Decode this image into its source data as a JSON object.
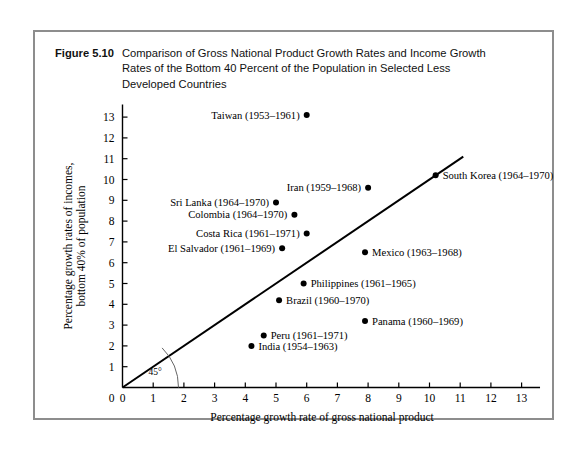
{
  "figure": {
    "label": "Figure 5.10",
    "caption_line1": "Comparison of Gross National Product Growth Rates and Income Growth",
    "caption_line2": "Rates of the Bottom 40 Percent of the Population in Selected Less",
    "caption_line3": "Developed Countries"
  },
  "chart_data": {
    "type": "scatter",
    "title": "",
    "xlabel": "Percentage growth rate of gross national product",
    "ylabel_line1": "Percentage growth rates of incomes,",
    "ylabel_line2": "bottom 40% of population",
    "xlim": [
      0,
      13.6
    ],
    "ylim": [
      0,
      13.6
    ],
    "xticks": [
      0,
      1,
      2,
      3,
      4,
      5,
      6,
      7,
      8,
      9,
      10,
      11,
      12,
      13
    ],
    "yticks": [
      0,
      1,
      2,
      3,
      4,
      5,
      6,
      7,
      8,
      9,
      10,
      11,
      12,
      13
    ],
    "xtick_labels": [
      "0",
      "1",
      "2",
      "3",
      "4",
      "5",
      "6",
      "7",
      "8",
      "9",
      "10",
      "11",
      "12",
      "13"
    ],
    "ytick_labels": [
      "0",
      "1",
      "2",
      "3",
      "4",
      "5",
      "6",
      "7",
      "8",
      "9",
      "10",
      "11",
      "12",
      "13"
    ],
    "grid": false,
    "legend": "none",
    "reference_line": {
      "name": "45-degree line",
      "annotation": "45°",
      "from": [
        0,
        0
      ],
      "to": [
        11.1,
        11.1
      ],
      "slope": 1
    },
    "points": [
      {
        "name": "Taiwan (1953–1961)",
        "x": 6.0,
        "y": 13.1,
        "label_side": "left"
      },
      {
        "name": "South Korea (1964–1970)",
        "x": 10.2,
        "y": 10.2,
        "label_side": "right"
      },
      {
        "name": "Iran (1959–1968)",
        "x": 8.0,
        "y": 9.6,
        "label_side": "left"
      },
      {
        "name": "Sri Lanka (1964–1970)",
        "x": 5.0,
        "y": 8.9,
        "label_side": "left"
      },
      {
        "name": "Colombia (1964–1970)",
        "x": 5.6,
        "y": 8.3,
        "label_side": "left"
      },
      {
        "name": "Costa Rica (1961–1971)",
        "x": 6.0,
        "y": 7.4,
        "label_side": "left"
      },
      {
        "name": "El Salvador (1961–1969)",
        "x": 5.2,
        "y": 6.7,
        "label_side": "left"
      },
      {
        "name": "Mexico (1963–1968)",
        "x": 7.9,
        "y": 6.5,
        "label_side": "right"
      },
      {
        "name": "Philippines (1961–1965)",
        "x": 5.9,
        "y": 5.0,
        "label_side": "right"
      },
      {
        "name": "Brazil (1960–1970)",
        "x": 5.1,
        "y": 4.2,
        "label_side": "right"
      },
      {
        "name": "Panama (1960–1969)",
        "x": 7.9,
        "y": 3.2,
        "label_side": "right"
      },
      {
        "name": "Peru (1961–1971)",
        "x": 4.6,
        "y": 2.5,
        "label_side": "right"
      },
      {
        "name": "India (1954–1963)",
        "x": 4.2,
        "y": 2.0,
        "label_side": "right"
      }
    ]
  },
  "colors": {
    "frame": "#8d8d8d",
    "axis": "#000000",
    "point": "#000000",
    "line": "#000000",
    "background": "#ffffff"
  }
}
